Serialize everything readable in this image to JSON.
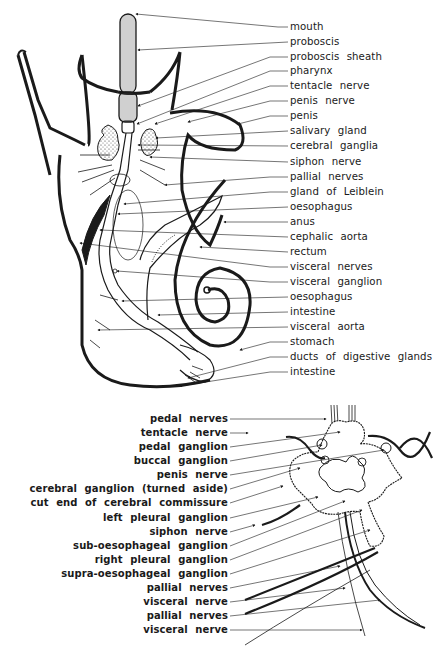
{
  "figure": {
    "upper_diagram": {
      "subject": "snail anatomy (whole-body dissection)",
      "labels": [
        {
          "text": "mouth",
          "y": 21
        },
        {
          "text": "proboscis",
          "y": 36
        },
        {
          "text": "proboscis sheath",
          "y": 51
        },
        {
          "text": "pharynx",
          "y": 65
        },
        {
          "text": "tentacle nerve",
          "y": 80
        },
        {
          "text": "penis nerve",
          "y": 95
        },
        {
          "text": "penis",
          "y": 110
        },
        {
          "text": "salivary gland",
          "y": 125
        },
        {
          "text": "cerebral ganglia",
          "y": 140
        },
        {
          "text": "siphon nerve",
          "y": 156
        },
        {
          "text": "pallial nerves",
          "y": 171
        },
        {
          "text": "gland of Leiblein",
          "y": 186
        },
        {
          "text": "oesophagus",
          "y": 201
        },
        {
          "text": "anus",
          "y": 216
        },
        {
          "text": "cephalic aorta",
          "y": 231
        },
        {
          "text": "rectum",
          "y": 246
        },
        {
          "text": "visceral nerves",
          "y": 261
        },
        {
          "text": "visceral ganglion",
          "y": 276
        },
        {
          "text": "oesophagus",
          "y": 291
        },
        {
          "text": "intestine",
          "y": 306
        },
        {
          "text": "visceral aorta",
          "y": 321
        },
        {
          "text": "stomach",
          "y": 336
        },
        {
          "text": "ducts of digestive glands",
          "y": 351
        },
        {
          "text": "intestine",
          "y": 366
        }
      ]
    },
    "lower_diagram": {
      "subject": "nerve ganglia (detail)",
      "labels": [
        {
          "text": "pedal nerves",
          "y": 414
        },
        {
          "text": "tentacle nerve",
          "y": 428
        },
        {
          "text": "pedal ganglion",
          "y": 442
        },
        {
          "text": "buccal ganglion",
          "y": 456
        },
        {
          "text": "penis nerve",
          "y": 470
        },
        {
          "text": "cerebral ganglion (turned aside)",
          "y": 484
        },
        {
          "text": "cut end of cerebral commissure",
          "y": 498
        },
        {
          "text": "left pleural ganglion",
          "y": 513
        },
        {
          "text": "siphon nerve",
          "y": 527
        },
        {
          "text": "sub-oesophageal ganglion",
          "y": 541
        },
        {
          "text": "right pleural ganglion",
          "y": 555
        },
        {
          "text": "supra-oesophageal ganglion",
          "y": 569
        },
        {
          "text": "pallial nerves",
          "y": 583
        },
        {
          "text": "visceral nerve",
          "y": 597
        },
        {
          "text": "pallial nerves",
          "y": 611
        },
        {
          "text": "visceral nerve",
          "y": 625
        }
      ]
    },
    "colors": {
      "ink": "#1a1a1a",
      "background": "#ffffff"
    }
  }
}
